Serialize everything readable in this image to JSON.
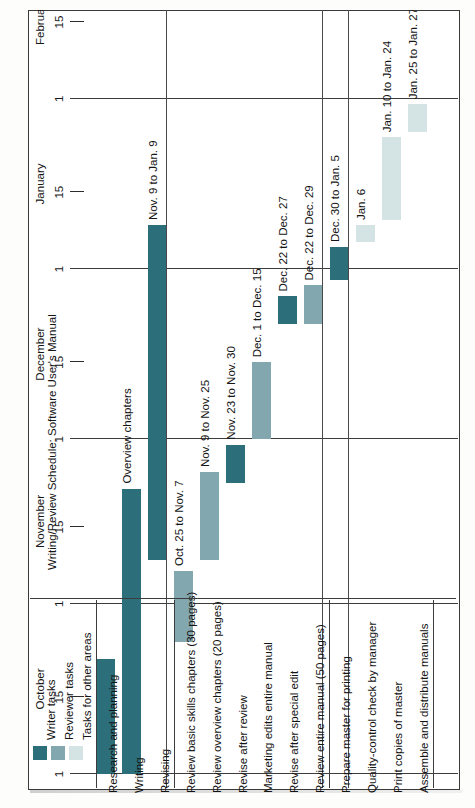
{
  "title": "Writing/Review Schedule: Software User's Manual",
  "legend": {
    "items": [
      {
        "label": "Writer tasks",
        "color": "#2c6f7b",
        "key": "writer"
      },
      {
        "label": "Reviewer tasks",
        "color": "#83a7ae",
        "key": "reviewer"
      },
      {
        "label": "Tasks for other areas",
        "color": "#d4e4e5",
        "key": "other"
      }
    ]
  },
  "chart_data": {
    "type": "bar",
    "orientation": "gantt-vertical-time",
    "title": "Writing/Review Schedule: Software User's Manual",
    "xlabel": "",
    "ylabel": "",
    "axis": {
      "months": [
        "October",
        "November",
        "December",
        "January",
        "February"
      ],
      "tick_labels": [
        "1",
        "15",
        "1",
        "15",
        "1",
        "15",
        "1",
        "15",
        "1",
        "15"
      ],
      "range_start": "Oct. 1",
      "range_end": "Feb. 15",
      "grid": true,
      "legend_position": "bottom-left"
    },
    "groups": [
      {
        "name": "Writer tasks",
        "key": "writer"
      },
      {
        "name": "Reviewer tasks",
        "key": "reviewer"
      },
      {
        "name": "Tasks for other areas",
        "key": "other"
      }
    ],
    "categories": [
      "Research and planning",
      "Writing",
      "Revising",
      "Review basic skills chapters (30 pages)",
      "Review overview chapters (20 pages)",
      "Revise after review",
      "Marketing edits entire manual",
      "Revise after special edit",
      "Review entire manual (50 pages)",
      "Prepare master for printing",
      "Quality-control check by manager",
      "Print copies of master",
      "Assemble and distribute manuals"
    ],
    "tasks": [
      {
        "name": "Research and planning",
        "group": "writer",
        "range": "",
        "start_day": 0,
        "end_day": 21,
        "segments": []
      },
      {
        "name": "Writing",
        "group": "writer",
        "range": "",
        "start_day": 14,
        "end_day": 52,
        "segments": [
          {
            "label": "Basic skills chapters",
            "start_day": 0,
            "end_day": 21
          },
          {
            "label": "Overview chapters",
            "start_day": 14,
            "end_day": 52
          }
        ]
      },
      {
        "name": "Revising",
        "group": "writer",
        "range": "Nov. 9 to Jan. 9",
        "start_day": 39,
        "end_day": 100,
        "segments": []
      },
      {
        "name": "Review basic skills chapters (30 pages)",
        "group": "reviewer",
        "range": "Oct. 25 to Nov. 7",
        "start_day": 24,
        "end_day": 37,
        "segments": []
      },
      {
        "name": "Review overview chapters (20 pages)",
        "group": "reviewer",
        "range": "Nov. 9 to Nov. 25",
        "start_day": 39,
        "end_day": 55,
        "segments": []
      },
      {
        "name": "Revise after review",
        "group": "writer",
        "range": "Nov. 23 to Nov. 30",
        "start_day": 53,
        "end_day": 60,
        "segments": []
      },
      {
        "name": "Marketing edits entire manual",
        "group": "reviewer",
        "range": "Dec. 1 to Dec. 15",
        "start_day": 61,
        "end_day": 75,
        "segments": []
      },
      {
        "name": "Revise after special edit",
        "group": "writer",
        "range": "Dec. 22 to Dec. 27",
        "start_day": 82,
        "end_day": 87,
        "segments": []
      },
      {
        "name": "Review entire manual (50 pages)",
        "group": "reviewer",
        "range": "Dec. 22 to Dec. 29",
        "start_day": 82,
        "end_day": 89,
        "segments": []
      },
      {
        "name": "Prepare master for printing",
        "group": "writer",
        "range": "Dec. 30 to Jan. 5",
        "start_day": 90,
        "end_day": 96,
        "segments": []
      },
      {
        "name": "Quality-control check by manager",
        "group": "other",
        "range": "Jan. 6",
        "start_day": 97,
        "end_day": 100,
        "segments": []
      },
      {
        "name": "Print copies of master",
        "group": "other",
        "range": "Jan. 10 to Jan. 24",
        "start_day": 101,
        "end_day": 116,
        "segments": []
      },
      {
        "name": "Assemble and distribute manuals",
        "group": "other",
        "range": "Jan. 25 to Jan. 27",
        "start_day": 117,
        "end_day": 122,
        "segments": []
      }
    ]
  }
}
